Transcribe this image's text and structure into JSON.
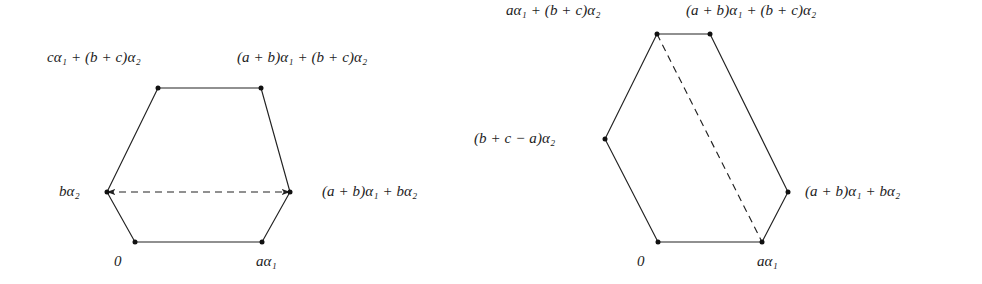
{
  "figure": {
    "type": "diagram",
    "background_color": "#ffffff",
    "stroke_color": "#222222",
    "dot_color": "#111111",
    "panels": [
      {
        "name": "left-hexagon",
        "vertices": [
          {
            "id": "v-origin",
            "x": 135,
            "y": 242,
            "label": "0",
            "label_x": 118,
            "label_y": 255,
            "anchor": "start"
          },
          {
            "id": "v-a-alpha1",
            "x": 262,
            "y": 242,
            "label": "aα₁",
            "label_x": 258,
            "label_y": 255,
            "anchor": "start"
          },
          {
            "id": "v-ab-b",
            "x": 290,
            "y": 192,
            "label": "(a + b)α₁ + bα₂",
            "label_x": 322,
            "label_y": 185,
            "anchor": "start"
          },
          {
            "id": "v-ab-bc",
            "x": 261,
            "y": 88,
            "label": "(a + b)α₁ + (b + c)α₂",
            "label_x": 237,
            "label_y": 57,
            "anchor": "start"
          },
          {
            "id": "v-c-bc",
            "x": 158,
            "y": 88,
            "label": "cα₁ + (b + c)α₂",
            "label_x": 47,
            "label_y": 57,
            "anchor": "start"
          },
          {
            "id": "v-b-alpha2",
            "x": 107,
            "y": 192,
            "label": "bα₂",
            "label_x": 59,
            "label_y": 185,
            "anchor": "start"
          }
        ],
        "dashed_edge": {
          "from": "v-b-alpha2",
          "to": "v-ab-b",
          "arrow_both_ends": true
        }
      },
      {
        "name": "right-hexagon",
        "vertices": [
          {
            "id": "v-origin-2",
            "x": 658,
            "y": 242,
            "label": "0",
            "label_x": 641,
            "label_y": 255,
            "anchor": "start"
          },
          {
            "id": "v-a-alpha1-2",
            "x": 762,
            "y": 242,
            "label": "aα₁",
            "label_x": 759,
            "label_y": 255,
            "anchor": "start"
          },
          {
            "id": "v-ab-b-2",
            "x": 788,
            "y": 192,
            "label": "(a + b)α₁ + bα₂",
            "label_x": 805,
            "label_y": 185,
            "anchor": "start"
          },
          {
            "id": "v-ab-bc-2",
            "x": 710,
            "y": 34,
            "label": "(a + b)α₁ + (b + c)α₂",
            "label_x": 686,
            "label_y": 5,
            "anchor": "start"
          },
          {
            "id": "v-a-bc",
            "x": 657,
            "y": 34,
            "label": "aα₁ + (b + c)α₂",
            "label_x": 506,
            "label_y": 5,
            "anchor": "start"
          },
          {
            "id": "v-bca",
            "x": 605,
            "y": 139,
            "label": "(b + c − a)α₂",
            "label_x": 474,
            "label_y": 132,
            "anchor": "start"
          }
        ],
        "dashed_edge": {
          "from": "v-a-bc",
          "to": "v-a-alpha1-2",
          "arrow_both_ends": false
        }
      }
    ]
  },
  "labels": {
    "left": {
      "origin": "0",
      "a_alpha1": "aα₁",
      "ab_alpha1_b_alpha2": "(a + b)α₁ + bα₂",
      "ab_alpha1_bc_alpha2": "(a + b)α₁ + (b + c)α₂",
      "c_alpha1_bc_alpha2": "cα₁ + (b + c)α₂",
      "b_alpha2": "bα₂"
    },
    "right": {
      "origin": "0",
      "a_alpha1": "aα₁",
      "ab_alpha1_b_alpha2": "(a + b)α₁ + bα₂",
      "ab_alpha1_bc_alpha2": "(a + b)α₁ + (b + c)α₂",
      "a_alpha1_bc_alpha2": "aα₁ + (b + c)α₂",
      "bc_minus_a_alpha2": "(b + c − a)α₂"
    }
  }
}
